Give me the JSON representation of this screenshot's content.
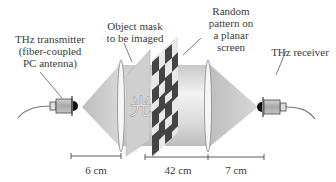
{
  "labels": {
    "transmitter": [
      "THz transmitter",
      "(fiber-coupled",
      "PC antenna)"
    ],
    "mask": [
      "Object mask",
      "to be imaged"
    ],
    "pattern": [
      "Random",
      "pattern on",
      "a planar",
      "screen"
    ],
    "receiver": "THz receiver"
  },
  "mask_character": "光",
  "dimensions": [
    {
      "name": "transmitter-to-lens",
      "value": "6 cm"
    },
    {
      "name": "lens-to-lens",
      "value": "42 cm"
    },
    {
      "name": "lens-to-receiver",
      "value": "7 cm"
    }
  ],
  "colors": {
    "beam": "#d4d4d4",
    "beam_dark": "#b8b8b8",
    "pattern_dark": "#444444",
    "pattern_light": "#e8e8e8",
    "device": "#b0b0b0",
    "line": "#333333"
  }
}
